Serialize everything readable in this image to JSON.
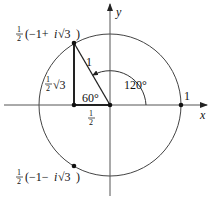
{
  "figure": {
    "type": "unit-circle-complex-plane",
    "axes": {
      "x_label": "x",
      "y_label": "y"
    },
    "radius_label": "1",
    "unit_point_label": "1",
    "angle_small": "60°",
    "angle_large": "120°",
    "horizontal_leg_label": {
      "num": "1",
      "den": "2"
    },
    "vertical_leg_label": {
      "num": "1",
      "den": "2",
      "rest": "√3"
    },
    "upper_point_label": {
      "num": "1",
      "den": "2",
      "rest": "(−1+",
      "i": "i",
      "sqrt": "√3",
      "close": ")"
    },
    "lower_point_label": {
      "num": "1",
      "den": "2",
      "rest": "(−1−",
      "i": "i",
      "sqrt": "√3",
      "close": ")"
    },
    "colors": {
      "stroke": "#222222",
      "thin": "#555555"
    }
  }
}
